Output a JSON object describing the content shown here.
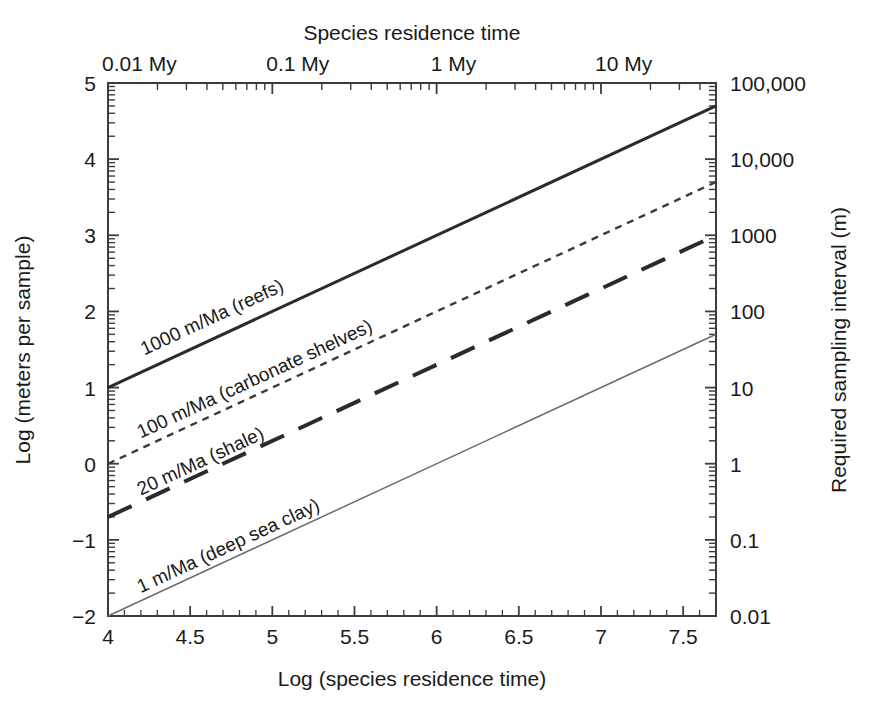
{
  "chart_data": {
    "type": "line",
    "title": "",
    "top_axis_title": "Species residence time",
    "xlabel": "Log (species residence time)",
    "ylabel": "Log (meters per sample)",
    "y2label": "Required sampling interval (m)",
    "xlim": [
      4,
      7.7
    ],
    "ylim": [
      -2,
      5
    ],
    "grid": false,
    "legend_position": "inline-labels",
    "x_ticks": [
      "4",
      "4.5",
      "5",
      "5.5",
      "6",
      "6.5",
      "7",
      "7.5"
    ],
    "x_tick_values": [
      4,
      4.5,
      5,
      5.5,
      6,
      6.5,
      7,
      7.5
    ],
    "y_ticks": [
      "5",
      "4",
      "3",
      "2",
      "1",
      "0",
      "-1",
      "-2"
    ],
    "y_tick_values": [
      5,
      4,
      3,
      2,
      1,
      0,
      -1,
      -2
    ],
    "y2_ticks": [
      "100,000",
      "10,000",
      "1000",
      "100",
      "10",
      "1",
      "0.1",
      "0.01"
    ],
    "y2_tick_values": [
      5,
      4,
      3,
      2,
      1,
      0,
      -1,
      -2
    ],
    "top_ticks": [
      "0.01 My",
      "0.1 My",
      "1 My",
      "10 My"
    ],
    "top_tick_values": [
      4,
      5,
      6,
      7
    ],
    "series": [
      {
        "name": "1000 m/Ma (reefs)",
        "label": "1000 m/Ma (reefs)",
        "style": "solid",
        "width": 3.0,
        "color": "#2b2b2b",
        "x": [
          4,
          7.7
        ],
        "y": [
          1.0,
          4.7
        ],
        "label_x": 4.22,
        "label_y": 1.42
      },
      {
        "name": "100 m/Ma (carbonate shelves)",
        "label": "100 m/Ma (carbonate shelves)",
        "style": "short-dash",
        "width": 2.4,
        "color": "#3a3a3a",
        "x": [
          4,
          7.7
        ],
        "y": [
          0.0,
          3.7
        ],
        "label_x": 4.2,
        "label_y": 0.33
      },
      {
        "name": "20 m/Ma (shale)",
        "label": "20 m/Ma (shale)",
        "style": "long-dash",
        "width": 4.0,
        "color": "#2b2b2b",
        "x": [
          4,
          7.7
        ],
        "y": [
          -0.7,
          3.0
        ],
        "label_x": 4.2,
        "label_y": -0.42
      },
      {
        "name": "1 m/Ma (deep sea clay)",
        "label": "1 m/Ma (deep sea clay)",
        "style": "thin-solid",
        "width": 1.5,
        "color": "#6b6b6b",
        "x": [
          4,
          7.7
        ],
        "y": [
          -2.0,
          1.7
        ],
        "label_x": 4.2,
        "label_y": -1.7
      }
    ]
  },
  "colors": {
    "background": "#ffffff",
    "axis": "#3c3c3c",
    "text": "#1a1a1a"
  }
}
